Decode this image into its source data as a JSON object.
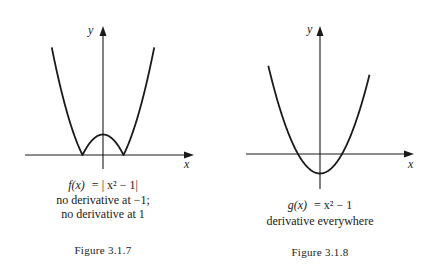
{
  "figures": [
    {
      "id": "fig-3-1-7",
      "function_name": "f",
      "formula_lhs": "f(x)",
      "formula_rhs": "= | x² − 1|",
      "caption_lines": [
        "no derivative at −1;",
        "no derivative at 1"
      ],
      "figure_label": "Figure 3.1.7",
      "x_label": "x",
      "y_label": "y",
      "curve": "abs(x^2 - 1)",
      "x_range": [
        -2.1,
        2.1
      ],
      "roots": [
        -1,
        1
      ],
      "corners": [
        -1,
        1
      ]
    },
    {
      "id": "fig-3-1-8",
      "function_name": "g",
      "formula_lhs": "g(x)",
      "formula_rhs": "= x² − 1",
      "caption_lines": [
        "derivative everywhere"
      ],
      "figure_label": "Figure 3.1.8",
      "x_label": "x",
      "y_label": "y",
      "curve": "x^2 - 1",
      "x_range": [
        -2.1,
        2.1
      ],
      "roots": [
        -1,
        1
      ],
      "minimum": [
        0,
        -1
      ]
    }
  ],
  "colors": {
    "ink": "#1a1a1a",
    "background": "#ffffff"
  }
}
